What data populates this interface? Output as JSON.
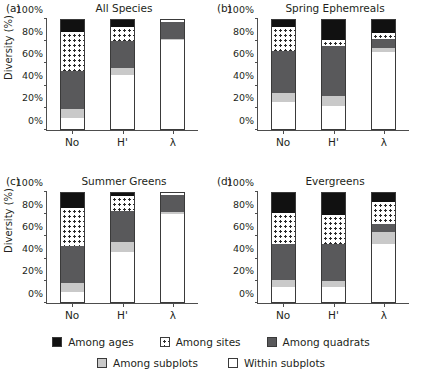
{
  "figure": {
    "ylabel": "Diversity (%)",
    "yticks": [
      "0%",
      "20%",
      "40%",
      "60%",
      "80%",
      "100%"
    ],
    "xticks": [
      "No",
      "H'",
      "λ"
    ]
  },
  "legend": {
    "row1": [
      {
        "label": "Among ages",
        "swatch": "ages",
        "color": "#111111"
      },
      {
        "label": "Among sites",
        "swatch": "sites",
        "color": "#ffffff"
      },
      {
        "label": "Among quadrats",
        "swatch": "quadrats",
        "color": "#59595b"
      }
    ],
    "row2": [
      {
        "label": "Among subplots",
        "swatch": "subplots",
        "color": "#c9c9c9"
      },
      {
        "label": "Within subplots",
        "swatch": "within",
        "color": "#ffffff"
      }
    ]
  },
  "panels": [
    {
      "tag": "(a)",
      "title": "All Species"
    },
    {
      "tag": "(b)",
      "title": "Spring Ephemreals"
    },
    {
      "tag": "(c)",
      "title": "Summer Greens"
    },
    {
      "tag": "(d)",
      "title": "Evergreens"
    }
  ],
  "chart_data": [
    {
      "type": "bar",
      "stacked": true,
      "panel": "(a)",
      "title": "All Species",
      "xlabel": "",
      "ylabel": "Diversity (%)",
      "categories": [
        "No",
        "H'",
        "λ"
      ],
      "ylim": [
        0,
        100
      ],
      "yticks": [
        0,
        20,
        40,
        60,
        80,
        100
      ],
      "grid": false,
      "legend_position": "bottom",
      "series": [
        {
          "name": "Within subplots",
          "values": [
            11,
            50,
            81
          ]
        },
        {
          "name": "Among subplots",
          "values": [
            8,
            6,
            1
          ]
        },
        {
          "name": "Among quadrats",
          "values": [
            34,
            24,
            15
          ]
        },
        {
          "name": "Among sites",
          "values": [
            35,
            13,
            3
          ]
        },
        {
          "name": "Among ages",
          "values": [
            12,
            7,
            0
          ]
        }
      ]
    },
    {
      "type": "bar",
      "stacked": true,
      "panel": "(b)",
      "title": "Spring Ephemreals",
      "xlabel": "",
      "ylabel": "Diversity (%)",
      "categories": [
        "No",
        "H'",
        "λ"
      ],
      "ylim": [
        0,
        100
      ],
      "yticks": [
        0,
        20,
        40,
        60,
        80,
        100
      ],
      "grid": false,
      "legend_position": "bottom",
      "series": [
        {
          "name": "Within subplots",
          "values": [
            25,
            22,
            70
          ]
        },
        {
          "name": "Among subplots",
          "values": [
            8,
            9,
            4
          ]
        },
        {
          "name": "Among quadrats",
          "values": [
            38,
            45,
            8
          ]
        },
        {
          "name": "Among sites",
          "values": [
            22,
            5,
            5
          ]
        },
        {
          "name": "Among ages",
          "values": [
            7,
            19,
            13
          ]
        }
      ]
    },
    {
      "type": "bar",
      "stacked": true,
      "panel": "(c)",
      "title": "Summer Greens",
      "xlabel": "",
      "ylabel": "Diversity (%)",
      "categories": [
        "No",
        "H'",
        "λ"
      ],
      "ylim": [
        0,
        100
      ],
      "yticks": [
        0,
        20,
        40,
        60,
        80,
        100
      ],
      "grid": false,
      "legend_position": "bottom",
      "series": [
        {
          "name": "Within subplots",
          "values": [
            10,
            46,
            80
          ]
        },
        {
          "name": "Among subplots",
          "values": [
            8,
            9,
            2
          ]
        },
        {
          "name": "Among quadrats",
          "values": [
            33,
            28,
            15
          ]
        },
        {
          "name": "Among sites",
          "values": [
            35,
            13,
            3
          ]
        },
        {
          "name": "Among ages",
          "values": [
            14,
            4,
            0
          ]
        }
      ]
    },
    {
      "type": "bar",
      "stacked": true,
      "panel": "(d)",
      "title": "Evergreens",
      "xlabel": "",
      "ylabel": "Diversity (%)",
      "categories": [
        "No",
        "H'",
        "λ"
      ],
      "ylim": [
        0,
        100
      ],
      "yticks": [
        0,
        20,
        40,
        60,
        80,
        100
      ],
      "grid": false,
      "legend_position": "bottom",
      "series": [
        {
          "name": "Within subplots",
          "values": [
            14,
            14,
            53
          ]
        },
        {
          "name": "Among subplots",
          "values": [
            7,
            6,
            11
          ]
        },
        {
          "name": "Among quadrats",
          "values": [
            32,
            33,
            7
          ]
        },
        {
          "name": "Among sites",
          "values": [
            28,
            26,
            20
          ]
        },
        {
          "name": "Among ages",
          "values": [
            19,
            21,
            9
          ]
        }
      ]
    }
  ]
}
